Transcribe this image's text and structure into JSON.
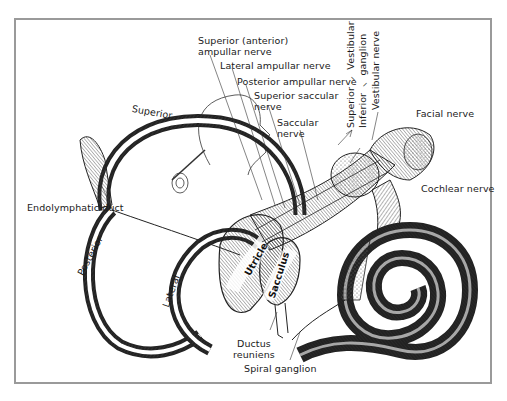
{
  "diagram": {
    "type": "anatomical illustration",
    "frame_color": "#9a9a9a",
    "line_color": "#1a1a1a",
    "labels": {
      "superior_anterior_ampullar_nerve_1": "Superior (anterior)",
      "superior_anterior_ampullar_nerve_2": "ampullar nerve",
      "lateral_ampullar_nerve": "Lateral ampullar nerve",
      "posterior_ampullar_nerve": "Posterior ampullar nerve",
      "superior_saccular_nerve_1": "Superior saccular",
      "superior_saccular_nerve_2": "nerve",
      "saccular_nerve_1": "Saccular",
      "saccular_nerve_2": "nerve",
      "vestibular_ganglion_superior": "Superior",
      "vestibular_ganglion_inferior": "Inferior",
      "vestibular_ganglion_word1": "Vestibular",
      "vestibular_ganglion_word2": "ganglion",
      "vestibular_nerve": "Vestibular nerve",
      "facial_nerve": "Facial nerve",
      "cochlear_nerve": "Cochlear nerve",
      "superior_canal": "Superior",
      "endolymphatic_duct": "Endolymphatic duct",
      "posterior_canal": "Posterior",
      "lateral_canal": "Lateral",
      "utricle": "Utricle",
      "sacculus": "Sacculus",
      "ductus_reuniens_1": "Ductus",
      "ductus_reuniens_2": "reuniens",
      "spiral_ganglion": "Spiral ganglion"
    }
  }
}
